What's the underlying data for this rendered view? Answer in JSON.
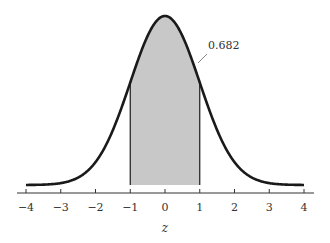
{
  "chart_data": {
    "type": "area",
    "title": "",
    "xlabel": "z",
    "ylabel": "",
    "xlim": [
      -4,
      4
    ],
    "x_ticks": [
      -4,
      -3,
      -2,
      -1,
      0,
      1,
      2,
      3,
      4
    ],
    "x_tick_labels": [
      "−4",
      "−3",
      "−2",
      "−1",
      "0",
      "1",
      "2",
      "3",
      "4"
    ],
    "curve": "standard normal density",
    "shaded_region": {
      "from": -1,
      "to": 1,
      "area": 0.682
    },
    "annotations": [
      {
        "text": "0.682",
        "points_to_x": 0.95
      }
    ],
    "grid": false,
    "legend": null
  },
  "colors": {
    "curve": "#1a1a1a",
    "fill": "#c8c8c8",
    "axis": "#333333"
  },
  "annotation_label": "0.682",
  "axis_title": "z"
}
